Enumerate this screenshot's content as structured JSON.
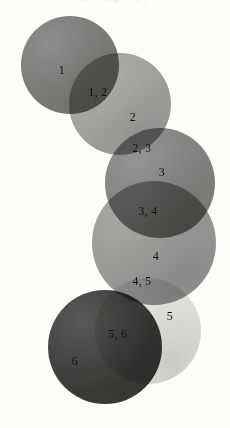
{
  "figure": {
    "top_clipped_caption": "(f)  e  n  g  ,  l  a  y",
    "background_color": "#fcfcfb",
    "label_color": "#101010",
    "width": 230,
    "height": 428
  },
  "chart_data": {
    "type": "diagram",
    "subtype": "overlapping-circle-chain",
    "title": "",
    "xlabel": "",
    "ylabel": "",
    "circles": [
      {
        "id": 1,
        "label": "1",
        "cx": 70,
        "cy": 65,
        "r": 49,
        "color": "#6f6f6f",
        "opacity": 0.92
      },
      {
        "id": 2,
        "label": "2",
        "cx": 120,
        "cy": 104,
        "r": 51,
        "color": "#9a9a9a",
        "opacity": 0.92
      },
      {
        "id": 3,
        "label": "3",
        "cx": 160,
        "cy": 183,
        "r": 55,
        "color": "#787878",
        "opacity": 0.92
      },
      {
        "id": 4,
        "label": "4",
        "cx": 154,
        "cy": 243,
        "r": 62,
        "color": "#8e8e8e",
        "opacity": 0.9
      },
      {
        "id": 5,
        "label": "5",
        "cx": 148,
        "cy": 331,
        "r": 53,
        "color": "#e2e2e2",
        "opacity": 0.95
      },
      {
        "id": 6,
        "label": "6",
        "cx": 105,
        "cy": 347,
        "r": 57,
        "color": "#303030",
        "opacity": 0.95
      }
    ],
    "intersection_labels": [
      {
        "id": "1-2",
        "label": "1, 2",
        "x": 98,
        "y": 92
      },
      {
        "id": "2-3",
        "label": "2, 3",
        "x": 142,
        "y": 148
      },
      {
        "id": "3-4",
        "label": "3, 4",
        "x": 148,
        "y": 211
      },
      {
        "id": "4-5",
        "label": "4, 5",
        "x": 142,
        "y": 281
      },
      {
        "id": "5-6",
        "label": "5, 6",
        "x": 118,
        "y": 334
      }
    ],
    "single_labels": [
      {
        "id": "1",
        "label": "1",
        "x": 62,
        "y": 70
      },
      {
        "id": "2",
        "label": "2",
        "x": 133,
        "y": 117
      },
      {
        "id": "3",
        "label": "3",
        "x": 162,
        "y": 172
      },
      {
        "id": "4",
        "label": "4",
        "x": 156,
        "y": 256
      },
      {
        "id": "5",
        "label": "5",
        "x": 170,
        "y": 316
      },
      {
        "id": "6",
        "label": "6",
        "x": 75,
        "y": 361
      }
    ]
  }
}
